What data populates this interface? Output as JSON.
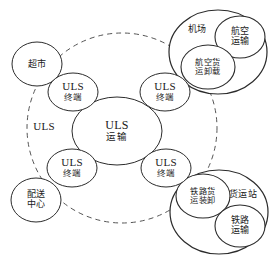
{
  "diagram": {
    "stroke_color": "#2b2b2b",
    "dashed_stroke_color": "#555555",
    "background_color": "#ffffff",
    "boundary": {
      "label": "ULS",
      "style": "dashed-circle",
      "cx": 122,
      "cy": 128,
      "r": 95,
      "label_x": 44,
      "label_y": 127
    },
    "core": {
      "en": "ULS",
      "cn": "运输",
      "cx": 117,
      "cy": 131,
      "rx": 45,
      "ry": 34
    },
    "terminals": [
      {
        "en": "ULS",
        "cn": "终端",
        "cx": 73,
        "cy": 92,
        "rx": 25,
        "ry": 19
      },
      {
        "en": "ULS",
        "cn": "终端",
        "cx": 165,
        "cy": 92,
        "rx": 25,
        "ry": 19
      },
      {
        "en": "ULS",
        "cn": "终端",
        "cx": 72,
        "cy": 168,
        "rx": 25,
        "ry": 19
      },
      {
        "en": "ULS",
        "cn": "终端",
        "cx": 166,
        "cy": 168,
        "rx": 25,
        "ry": 19
      }
    ],
    "external_nodes": [
      {
        "cn": "超市",
        "cx": 37,
        "cy": 64,
        "rx": 25,
        "ry": 22
      },
      {
        "cn1": "配送",
        "cn2": "中心",
        "cx": 36,
        "cy": 200,
        "rx": 25,
        "ry": 22
      }
    ],
    "clusters": [
      {
        "name": "airport-cluster",
        "outer": {
          "cn": "机场",
          "cx": 218,
          "cy": 52,
          "rx": 49,
          "ry": 42,
          "label_x": 197,
          "label_y": 30
        },
        "inner": [
          {
            "cn1": "航空",
            "cn2": "运输",
            "cx": 240,
            "cy": 37,
            "rx": 25,
            "ry": 21
          },
          {
            "cn1": "航空货",
            "cn2": "运卸载",
            "cx": 208,
            "cy": 67,
            "rx": 27,
            "ry": 22
          }
        ]
      },
      {
        "name": "freight-station-cluster",
        "outer": {
          "cn": "货运站",
          "cx": 219,
          "cy": 212,
          "rx": 49,
          "ry": 42,
          "label_x": 243,
          "label_y": 195
        },
        "inner": [
          {
            "cn1": "铁路货",
            "cn2": "运装卸",
            "cx": 203,
            "cy": 196,
            "rx": 27,
            "ry": 22
          },
          {
            "cn1": "铁路",
            "cn2": "运输",
            "cx": 240,
            "cy": 226,
            "rx": 25,
            "ry": 21
          }
        ]
      }
    ],
    "labels_flat": {
      "uls_boundary": "ULS",
      "uls_core_en": "ULS",
      "uls_core_cn": "运输",
      "terminal_en": "ULS",
      "terminal_cn": "终端",
      "supermarket": "超市",
      "distribution_center_l1": "配送",
      "distribution_center_l2": "中心",
      "airport": "机场",
      "air_transport_l1": "航空",
      "air_transport_l2": "运输",
      "air_cargo_l1": "航空货",
      "air_cargo_l2": "运卸载",
      "freight_station": "货运站",
      "rail_cargo_l1": "铁路货",
      "rail_cargo_l2": "运装卸",
      "rail_transport_l1": "铁路",
      "rail_transport_l2": "运输"
    }
  }
}
